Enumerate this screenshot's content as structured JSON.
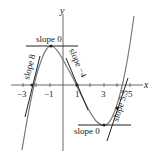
{
  "axes": {
    "x_label": "x",
    "y_label": "y",
    "x_ticks": [
      "−3",
      "−1",
      "1",
      "3",
      "5"
    ]
  },
  "curve": {
    "description": "cubic-like curve with local max near x=-1 and local min near x=3",
    "color": "#777777"
  },
  "tangents": [
    {
      "label": "slope 8",
      "at_x": "-2.4"
    },
    {
      "label": "slope 0",
      "at_x": "-1"
    },
    {
      "label": "slope −4",
      "at_x": "1"
    },
    {
      "label": "slope 0",
      "at_x": "3"
    },
    {
      "label": "slope 5.5",
      "at_x": "4"
    }
  ],
  "colors": {
    "axis": "#333333",
    "tangent": "#222222",
    "curve": "#7a7a7a"
  }
}
